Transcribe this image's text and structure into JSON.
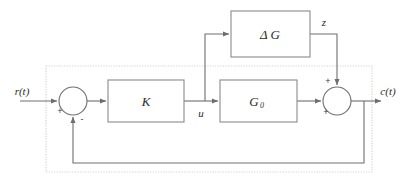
{
  "diagram": {
    "type": "control-block-diagram",
    "canvas": {
      "width": 417,
      "height": 187
    },
    "colors": {
      "background": "#ffffff",
      "line": "#6e6e6e",
      "block_stroke": "#8a8a8a",
      "boundary_dotted": "#d6d6d6",
      "text": "#2b2b2b"
    },
    "blocks": [
      {
        "id": "delta-g",
        "label": "Δ G",
        "label_main": "Δ G",
        "subscript": "",
        "x": 231,
        "y": 11,
        "width": 79,
        "height": 46
      },
      {
        "id": "gain-k",
        "label": "K",
        "label_main": "K",
        "subscript": "",
        "x": 108,
        "y": 80,
        "width": 76,
        "height": 42
      },
      {
        "id": "plant-g0",
        "label": "G₀",
        "label_main": "G",
        "subscript": "0",
        "x": 220,
        "y": 80,
        "width": 77,
        "height": 42
      }
    ],
    "summing_junctions": [
      {
        "id": "error-sum",
        "cx": 73,
        "cy": 101,
        "r": 14,
        "signs": [
          {
            "value": "+",
            "position": "left",
            "x": 60,
            "y": 113
          },
          {
            "value": "-",
            "position": "bottom",
            "x": 80,
            "y": 121
          }
        ]
      },
      {
        "id": "output-sum",
        "cx": 337,
        "cy": 101,
        "r": 14,
        "signs": [
          {
            "value": "+",
            "position": "top",
            "x": 326,
            "y": 82
          },
          {
            "value": "+",
            "position": "left",
            "x": 324,
            "y": 114
          }
        ]
      }
    ],
    "signals": [
      {
        "id": "reference",
        "label": "r(t)",
        "x": 22,
        "y": 95
      },
      {
        "id": "control",
        "label": "u",
        "x": 200,
        "y": 116
      },
      {
        "id": "uncertainty-output",
        "label": "z",
        "x": 320,
        "y": 23
      },
      {
        "id": "output",
        "label": "c(t)",
        "x": 385,
        "y": 95
      }
    ],
    "boundary": {
      "id": "plant-boundary",
      "style": "dotted",
      "x": 46,
      "y": 66,
      "width": 326,
      "height": 106
    },
    "connections": [
      {
        "from": "reference-input",
        "to": "error-sum",
        "arrow": true
      },
      {
        "from": "error-sum",
        "to": "gain-k",
        "arrow": true
      },
      {
        "from": "gain-k",
        "to": "control-branch",
        "arrow": false
      },
      {
        "from": "control-branch",
        "to": "plant-g0",
        "arrow": true
      },
      {
        "from": "control-branch",
        "to": "delta-g",
        "arrow": true
      },
      {
        "from": "delta-g",
        "to": "output-sum",
        "arrow": true,
        "label": "z"
      },
      {
        "from": "plant-g0",
        "to": "output-sum",
        "arrow": true
      },
      {
        "from": "output-sum",
        "to": "output",
        "arrow": true
      },
      {
        "from": "output-branch",
        "to": "error-sum",
        "arrow": true,
        "path": "feedback"
      }
    ]
  }
}
